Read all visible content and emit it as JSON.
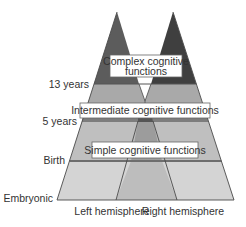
{
  "diagram": {
    "type": "brain-development-pyramid",
    "age_labels": {
      "thirteen": "13 years",
      "five": "5 years",
      "birth": "Birth",
      "embryonic": "Embryonic"
    },
    "function_boxes": {
      "complex_line1": "Complex cognitive",
      "complex_line2": "functions",
      "intermediate": "Intermediate cognitive functions",
      "simple": "Simple cognitive functions"
    },
    "axis_labels": {
      "left": "Left hemisphere",
      "right": "Right hemisphere"
    },
    "colors": {
      "left_peak": "#5c5c5c",
      "right_peak": "#3f3f3f",
      "intermediate_band": "#a8a8a8",
      "five_year_line": "#7a7a7a",
      "simple_band": "#bdbdbd",
      "center_column_upper": "#9a9a9a",
      "embryonic_band": "#d4d4d4",
      "center_column_lower": "#bcbcbc",
      "outline": "#4a4a4a",
      "box_fill": "#ffffff"
    }
  }
}
